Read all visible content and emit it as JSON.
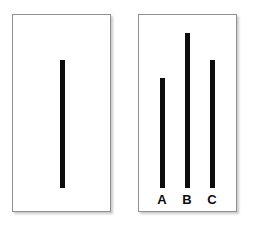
{
  "figure": {
    "name": "asch-line-judgment-stimulus",
    "background_color": "#ffffff",
    "width": 255,
    "height": 226
  },
  "style": {
    "line_color": "#0d0d0d",
    "card_border_color": "#8d8f91",
    "card_background": "#ffffff",
    "label_color": "#0d0d0d",
    "line_thickness_px": 5
  },
  "reference_card": {
    "label": "",
    "line": {
      "id": "reference-line",
      "label": "",
      "length_px": 128,
      "baseline_y_px": 188,
      "top_y_px": 60,
      "center_x_px": 62
    }
  },
  "comparison_card": {
    "label": "",
    "lines": [
      {
        "id": "line-a",
        "label": "A",
        "length_px": 110,
        "baseline_y_px": 188,
        "top_y_px": 78,
        "center_x_px": 162
      },
      {
        "id": "line-b",
        "label": "B",
        "length_px": 155,
        "baseline_y_px": 188,
        "top_y_px": 33,
        "center_x_px": 187
      },
      {
        "id": "line-c",
        "label": "C",
        "length_px": 128,
        "baseline_y_px": 188,
        "top_y_px": 60,
        "center_x_px": 212
      }
    ]
  },
  "chart_data": {
    "type": "bar",
    "title": "",
    "subtitle": "",
    "xlabel": "",
    "ylabel": "",
    "orientation": "vertical",
    "grid": false,
    "legend": null,
    "panels": [
      {
        "name": "reference",
        "categories": [
          ""
        ],
        "values": [
          128
        ]
      },
      {
        "name": "comparison",
        "categories": [
          "A",
          "B",
          "C"
        ],
        "values": [
          110,
          155,
          128
        ]
      }
    ],
    "annotations": []
  }
}
